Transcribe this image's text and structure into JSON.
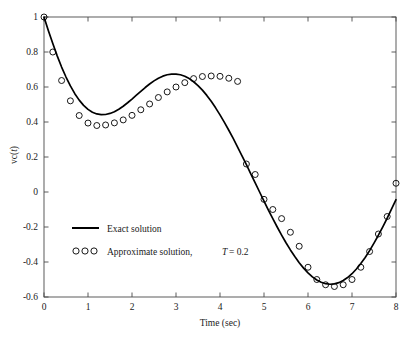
{
  "chart_data": {
    "type": "line",
    "title": "",
    "xlabel": "Time (sec)",
    "ylabel": "vc(t)",
    "xlim": [
      0,
      8
    ],
    "ylim": [
      -0.6,
      1.0
    ],
    "xticks": [
      "0",
      "1",
      "2",
      "3",
      "4",
      "5",
      "6",
      "7",
      "8"
    ],
    "xtick_values": [
      0,
      1,
      2,
      3,
      4,
      5,
      6,
      7,
      8
    ],
    "yticks": [
      "1",
      "0.8",
      "0.6",
      "0.4",
      "0.2",
      "0",
      "-0.2",
      "-0.4",
      "-0.6"
    ],
    "ytick_values": [
      1,
      0.8,
      0.6,
      0.4,
      0.2,
      0,
      -0.2,
      -0.4,
      -0.6
    ],
    "grid": false,
    "legend_position": "lower-left-inside",
    "series": [
      {
        "name": "Exact solution",
        "style": "solid-line",
        "color": "#000000",
        "x": [
          0.0,
          0.1,
          0.2,
          0.3,
          0.4,
          0.5,
          0.6,
          0.7,
          0.8,
          0.9,
          1.0,
          1.1,
          1.2,
          1.3,
          1.4,
          1.5,
          1.6,
          1.7,
          1.8,
          1.9,
          2.0,
          2.1,
          2.2,
          2.3,
          2.4,
          2.5,
          2.6,
          2.7,
          2.8,
          2.9,
          3.0,
          3.1,
          3.2,
          3.3,
          3.4,
          3.5,
          3.6,
          3.7,
          3.8,
          3.9,
          4.0,
          4.1,
          4.2,
          4.3,
          4.4,
          4.5,
          4.6,
          4.7,
          4.8,
          4.9,
          5.0,
          5.1,
          5.2,
          5.3,
          5.4,
          5.5,
          5.6,
          5.7,
          5.8,
          5.9,
          6.0,
          6.1,
          6.2,
          6.3,
          6.4,
          6.5,
          6.6,
          6.7,
          6.8,
          6.9,
          7.0,
          7.1,
          7.2,
          7.3,
          7.4,
          7.5,
          7.6,
          7.7,
          7.8,
          7.9,
          8.0
        ],
        "y": [
          1.0,
          0.922,
          0.848,
          0.778,
          0.714,
          0.657,
          0.606,
          0.562,
          0.525,
          0.495,
          0.472,
          0.456,
          0.446,
          0.442,
          0.443,
          0.449,
          0.459,
          0.473,
          0.49,
          0.51,
          0.531,
          0.553,
          0.575,
          0.597,
          0.617,
          0.635,
          0.65,
          0.662,
          0.67,
          0.674,
          0.674,
          0.67,
          0.661,
          0.648,
          0.63,
          0.608,
          0.582,
          0.552,
          0.518,
          0.481,
          0.441,
          0.398,
          0.353,
          0.306,
          0.257,
          0.207,
          0.156,
          0.104,
          0.052,
          0.0,
          -0.052,
          -0.103,
          -0.152,
          -0.2,
          -0.246,
          -0.29,
          -0.331,
          -0.369,
          -0.404,
          -0.435,
          -0.462,
          -0.485,
          -0.503,
          -0.516,
          -0.524,
          -0.527,
          -0.525,
          -0.518,
          -0.506,
          -0.489,
          -0.467,
          -0.44,
          -0.409,
          -0.374,
          -0.335,
          -0.292,
          -0.247,
          -0.199,
          -0.149,
          -0.097,
          -0.044
        ]
      },
      {
        "name": "Approximate solution,",
        "style": "open-circles",
        "color": "#000000",
        "sample_period_label": "T = 0.2",
        "sample_period": 0.2,
        "x": [
          0.0,
          0.2,
          0.4,
          0.6,
          0.8,
          1.0,
          1.2,
          1.4,
          1.6,
          1.8,
          2.0,
          2.2,
          2.4,
          2.6,
          2.8,
          3.0,
          3.2,
          3.4,
          3.6,
          3.8,
          4.0,
          4.2,
          4.4,
          4.6,
          4.8,
          5.0,
          5.2,
          5.4,
          5.6,
          5.8,
          6.0,
          6.2,
          6.4,
          6.6,
          6.8,
          7.0,
          7.2,
          7.4,
          7.6,
          7.8,
          8.0
        ],
        "y": [
          1.0,
          0.8,
          0.637,
          0.521,
          0.437,
          0.394,
          0.38,
          0.383,
          0.395,
          0.412,
          0.438,
          0.47,
          0.503,
          0.54,
          0.572,
          0.6,
          0.625,
          0.648,
          0.66,
          0.663,
          0.661,
          0.65,
          0.632,
          0.606,
          0.572,
          0.532,
          0.485,
          0.432,
          0.375,
          0.314,
          0.25,
          0.184,
          0.117,
          0.05,
          -0.018,
          -0.084,
          -0.148,
          -0.209,
          -0.266,
          -0.318,
          -0.365
        ]
      }
    ],
    "approx_second_half_x": [
      4.6,
      4.8,
      5.0,
      5.2,
      5.4,
      5.6,
      5.8,
      6.0,
      6.2,
      6.4,
      6.6,
      6.8,
      7.0,
      7.2,
      7.4,
      7.6,
      7.8,
      8.0
    ],
    "approx_second_half_y": [
      0.16,
      0.1,
      -0.042,
      -0.1,
      -0.152,
      -0.23,
      -0.31,
      -0.43,
      -0.5,
      -0.53,
      -0.54,
      -0.53,
      -0.5,
      -0.43,
      -0.34,
      -0.24,
      -0.14,
      0.05
    ]
  },
  "legend": {
    "items": [
      {
        "label": "Exact solution",
        "marker": "line"
      },
      {
        "label": "Approximate solution,",
        "marker": "circles",
        "suffix_italic": "T",
        "suffix_rest": "= 0.2"
      }
    ]
  },
  "axes": {
    "x_axis_title": "Time (sec)",
    "y_axis_title_prefix": "vc(",
    "y_axis_title_italic": "t",
    "y_axis_title_suffix": ")"
  }
}
